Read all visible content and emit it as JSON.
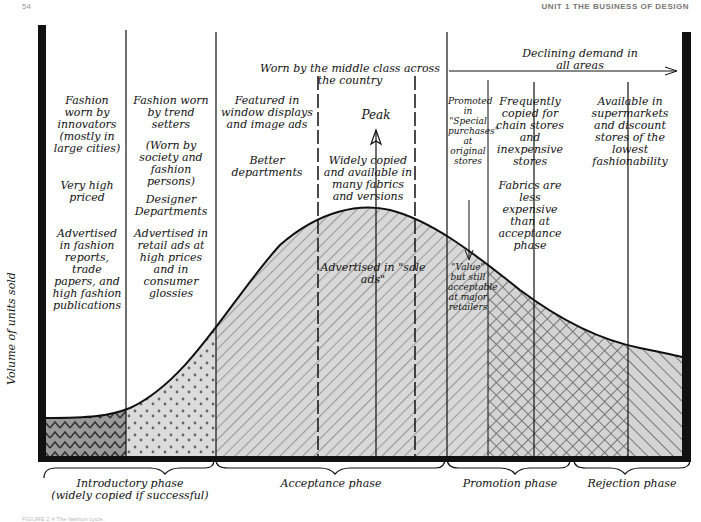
{
  "page_header": {
    "left": "54",
    "right": "UNIT 1  THE BUSINESS OF DESIGN"
  },
  "axis": {
    "y_label": "Volume of units sold"
  },
  "top_annotations": {
    "middle_class": "Worn by the middle class across the country",
    "declining": "Declining demand in all areas",
    "peak": "Peak"
  },
  "columns": [
    {
      "id": "innovators",
      "texts": [
        "Fashion worn by innovators (mostly in large cities)",
        "Very high priced",
        "Advertised in fashion reports, trade papers, and high fashion publications"
      ]
    },
    {
      "id": "trend-setters",
      "texts": [
        "Fashion worn by trend setters",
        "(Worn by society and fashion persons)",
        "Designer Departments",
        "Advertised in retail ads at high prices and in consumer glossies"
      ]
    },
    {
      "id": "window-displays",
      "texts": [
        "Featured in window displays and image ads",
        "Better departments"
      ]
    },
    {
      "id": "widely-copied",
      "texts": [
        "Widely copied and available in many fabrics and versions",
        "Advertised in \"sale ads\""
      ]
    },
    {
      "id": "promoted",
      "texts": [
        "Promoted in \"Special purchases\" at original stores",
        "\"Value\" but still acceptable at major retailers"
      ]
    },
    {
      "id": "chain-stores",
      "texts": [
        "Frequently copied for chain stores and inexpensive stores",
        "Fabrics are less expensive than at acceptance phase"
      ]
    },
    {
      "id": "supermarkets",
      "texts": [
        "Available in supermarkets and discount stores of the lowest fashionability"
      ]
    }
  ],
  "phases": [
    {
      "label": "Introductory phase",
      "sublabel": "(widely copied if successful)"
    },
    {
      "label": "Acceptance phase"
    },
    {
      "label": "Promotion phase"
    },
    {
      "label": "Rejection phase"
    }
  ],
  "caption": "FIGURE 2.4  The fashion cycle.",
  "colors": {
    "ink": "#111111",
    "fill": "#d6d6d6",
    "hatch": "#8a8a8a"
  }
}
